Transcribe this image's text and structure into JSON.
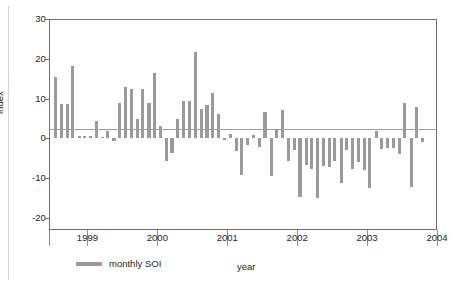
{
  "chart_data": {
    "type": "bar",
    "title": "",
    "xlabel": "year",
    "ylabel": "index",
    "ylim": [
      -23,
      30
    ],
    "yticks": [
      30,
      20,
      10,
      0,
      -10,
      -20
    ],
    "ytick_labels": [
      "30",
      "20",
      "10",
      "0",
      "-10",
      "-20"
    ],
    "xlim": [
      1998.45,
      2004.0
    ],
    "xticks": [
      1999,
      2000,
      2001,
      2002,
      2003,
      2004
    ],
    "xtick_labels": [
      "1999",
      "2000",
      "2001",
      "2002",
      "2003",
      "2004"
    ],
    "grid": false,
    "legend_position": "below-left",
    "series": [
      {
        "name": "monthly SOI",
        "color": "#9a9a9a",
        "x": [
          1998.54,
          1998.63,
          1998.71,
          1998.79,
          1998.88,
          1998.96,
          1999.04,
          1999.13,
          1999.21,
          1999.29,
          1999.38,
          1999.46,
          1999.54,
          1999.63,
          1999.71,
          1999.79,
          1999.88,
          1999.96,
          2000.04,
          2000.13,
          2000.21,
          2000.29,
          2000.38,
          2000.46,
          2000.54,
          2000.63,
          2000.71,
          2000.79,
          2000.88,
          2000.96,
          2001.04,
          2001.13,
          2001.21,
          2001.29,
          2001.38,
          2001.46,
          2001.54,
          2001.63,
          2001.71,
          2001.79,
          2001.88,
          2001.96,
          2002.04,
          2002.13,
          2002.21,
          2002.29,
          2002.38,
          2002.46,
          2002.54,
          2002.63,
          2002.71,
          2002.79,
          2002.88,
          2002.96,
          2003.04,
          2003.13,
          2003.21,
          2003.29,
          2003.38,
          2003.46,
          2003.54,
          2003.63,
          2003.71,
          2003.79
        ],
        "values": [
          15.4,
          8.6,
          8.7,
          18.2,
          0.6,
          0.6,
          0.7,
          4.5,
          0.4,
          1.8,
          -0.6,
          9.0,
          12.8,
          12.5,
          4.8,
          12.4,
          9.0,
          16.4,
          3.2,
          -5.6,
          -3.7,
          4.9,
          9.4,
          9.3,
          21.8,
          7.3,
          8.5,
          11.4,
          6.2,
          -0.5,
          1.2,
          -3.2,
          -9.2,
          -1.7,
          0.9,
          -2.1,
          6.6,
          -9.4,
          2.0,
          7.2,
          -5.6,
          -2.8,
          -14.8,
          -6.7,
          -7.8,
          -14.9,
          -6.9,
          -7.3,
          -5.7,
          -11.1,
          -2.8,
          -7.7,
          -6.0,
          -7.9,
          -12.4,
          1.9,
          -2.6,
          -2.3,
          -2.5,
          -3.9,
          9.0,
          -12.1,
          8.0,
          -0.9
        ]
      }
    ]
  },
  "legend": {
    "label": "monthly SOI"
  },
  "axes": {
    "y_title": "index",
    "x_title": "year"
  }
}
